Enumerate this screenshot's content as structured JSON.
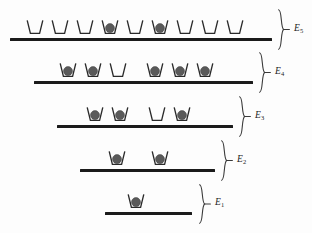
{
  "figure": {
    "particle_color": "#5a5a5a",
    "line_color": "#1b1b1b",
    "stroke_color": "#2a2a2a",
    "background_color": "#fdfdfd"
  },
  "chart_data": {
    "type": "diagram",
    "xlabel": "",
    "ylabel": "Energy",
    "legend": [],
    "grid": false,
    "levels": [
      {
        "label": "E",
        "subscript": "5",
        "label_full": "E5",
        "order_from_bottom": 5,
        "line_x_start": 10,
        "line_x_end": 272,
        "line_y": 38,
        "site_count": 9,
        "occupied_count": 2,
        "empty_count": 7,
        "sites": [
          {
            "index": 1,
            "x": 35,
            "occupied": false
          },
          {
            "index": 2,
            "x": 60,
            "occupied": false
          },
          {
            "index": 3,
            "x": 85,
            "occupied": false
          },
          {
            "index": 4,
            "x": 110,
            "occupied": true
          },
          {
            "index": 5,
            "x": 135,
            "occupied": false
          },
          {
            "index": 6,
            "x": 160,
            "occupied": true
          },
          {
            "index": 7,
            "x": 185,
            "occupied": false
          },
          {
            "index": 8,
            "x": 210,
            "occupied": false
          },
          {
            "index": 9,
            "x": 235,
            "occupied": false
          }
        ],
        "brace": {
          "x": 277,
          "y_top": 9,
          "y_bottom": 50,
          "label_x": 294,
          "label_y": 25
        }
      },
      {
        "label": "E",
        "subscript": "4",
        "label_full": "E4",
        "order_from_bottom": 4,
        "line_x_start": 34,
        "line_x_end": 253,
        "line_y": 81,
        "site_count": 6,
        "occupied_count": 5,
        "empty_count": 1,
        "sites": [
          {
            "index": 1,
            "x": 68,
            "occupied": true
          },
          {
            "index": 2,
            "x": 93,
            "occupied": true
          },
          {
            "index": 3,
            "x": 118,
            "occupied": false
          },
          {
            "index": 4,
            "x": 155,
            "occupied": true
          },
          {
            "index": 5,
            "x": 180,
            "occupied": true
          },
          {
            "index": 6,
            "x": 205,
            "occupied": true
          }
        ],
        "brace": {
          "x": 258,
          "y_top": 52,
          "y_bottom": 93,
          "label_x": 275,
          "label_y": 68
        }
      },
      {
        "label": "E",
        "subscript": "3",
        "label_full": "E3",
        "order_from_bottom": 3,
        "line_x_start": 57,
        "line_x_end": 233,
        "line_y": 125,
        "site_count": 4,
        "occupied_count": 3,
        "empty_count": 1,
        "sites": [
          {
            "index": 1,
            "x": 95,
            "occupied": true
          },
          {
            "index": 2,
            "x": 120,
            "occupied": true
          },
          {
            "index": 3,
            "x": 157,
            "occupied": false
          },
          {
            "index": 4,
            "x": 182,
            "occupied": true
          }
        ],
        "brace": {
          "x": 238,
          "y_top": 96,
          "y_bottom": 137,
          "label_x": 255,
          "label_y": 112
        }
      },
      {
        "label": "E",
        "subscript": "2",
        "label_full": "E2",
        "order_from_bottom": 2,
        "line_x_start": 80,
        "line_x_end": 215,
        "line_y": 169,
        "site_count": 2,
        "occupied_count": 2,
        "empty_count": 0,
        "sites": [
          {
            "index": 1,
            "x": 117,
            "occupied": true
          },
          {
            "index": 2,
            "x": 160,
            "occupied": true
          }
        ],
        "brace": {
          "x": 220,
          "y_top": 140,
          "y_bottom": 181,
          "label_x": 237,
          "label_y": 156
        }
      },
      {
        "label": "E",
        "subscript": "1",
        "label_full": "E1",
        "order_from_bottom": 1,
        "line_x_start": 105,
        "line_x_end": 192,
        "line_y": 212,
        "site_count": 1,
        "occupied_count": 1,
        "empty_count": 0,
        "sites": [
          {
            "index": 1,
            "x": 136,
            "occupied": true
          }
        ],
        "brace": {
          "x": 198,
          "y_top": 184,
          "y_bottom": 224,
          "label_x": 215,
          "label_y": 200
        }
      }
    ]
  }
}
